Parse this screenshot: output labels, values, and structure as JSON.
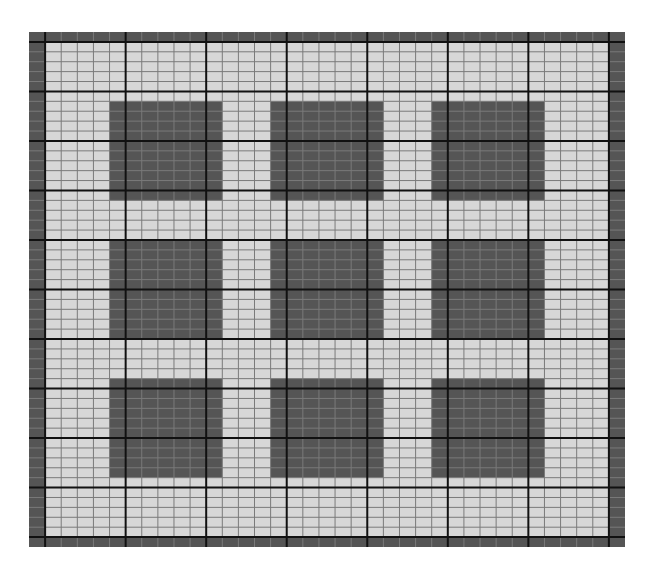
{
  "chart_data": {
    "type": "grid-pattern",
    "title": "",
    "grid": {
      "columns": 37,
      "rows": 52,
      "major_every": 5,
      "major_offset_col": 1,
      "major_offset_row": 1
    },
    "border": {
      "width_cells": 1,
      "fill": "dark"
    },
    "blocks": [
      {
        "row_block": 1,
        "col_block": 1,
        "col_start": 5,
        "col_end": 12,
        "row_start": 7,
        "row_end": 17
      },
      {
        "row_block": 1,
        "col_block": 2,
        "col_start": 15,
        "col_end": 22,
        "row_start": 7,
        "row_end": 17
      },
      {
        "row_block": 1,
        "col_block": 3,
        "col_start": 25,
        "col_end": 32,
        "row_start": 7,
        "row_end": 17
      },
      {
        "row_block": 2,
        "col_block": 1,
        "col_start": 5,
        "col_end": 12,
        "row_start": 21,
        "row_end": 31
      },
      {
        "row_block": 2,
        "col_block": 2,
        "col_start": 15,
        "col_end": 22,
        "row_start": 21,
        "row_end": 31
      },
      {
        "row_block": 2,
        "col_block": 3,
        "col_start": 25,
        "col_end": 32,
        "row_start": 21,
        "row_end": 31
      },
      {
        "row_block": 3,
        "col_block": 1,
        "col_start": 5,
        "col_end": 12,
        "row_start": 35,
        "row_end": 45
      },
      {
        "row_block": 3,
        "col_block": 2,
        "col_start": 15,
        "col_end": 22,
        "row_start": 35,
        "row_end": 45
      },
      {
        "row_block": 3,
        "col_block": 3,
        "col_start": 25,
        "col_end": 32,
        "row_start": 35,
        "row_end": 45
      }
    ],
    "colors": {
      "light_fill": "#d7d7d7",
      "dark_fill": "#555555",
      "minor_line": "#7a7a7a",
      "major_line": "#111111"
    }
  }
}
